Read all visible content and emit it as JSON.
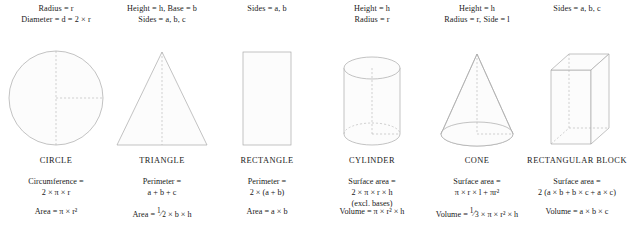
{
  "sheet": {
    "title": "Geometry formulas reference",
    "columns": [
      {
        "id": "circle",
        "name": "CIRCLE",
        "dimensions": [
          "Radius = r",
          "Diameter = d = 2 × r"
        ],
        "formula_1_label": "Circumference =",
        "formula_1_value": "2 × π × r",
        "formula_2": "Area = π × r²",
        "figure": "circle-figure"
      },
      {
        "id": "triangle",
        "name": "TRIANGLE",
        "dimensions": [
          "Height = h, Base = b",
          "Sides = a, b, c"
        ],
        "formula_1_label": "Perimeter =",
        "formula_1_value": "a + b + c",
        "formula_2_prefix": "Area = ",
        "formula_2_fraction_num": "1",
        "formula_2_fraction_den": "2",
        "formula_2_suffix": " × b × h",
        "figure": "triangle-figure"
      },
      {
        "id": "rectangle",
        "name": "RECTANGLE",
        "dimensions": [
          "Sides = a, b"
        ],
        "formula_1_label": "Perimeter =",
        "formula_1_value": "2 × (a + b)",
        "formula_2": "Area = a × b",
        "figure": "rectangle-figure"
      },
      {
        "id": "cylinder",
        "name": "CYLINDER",
        "dimensions": [
          "Height = h",
          "Radius = r"
        ],
        "formula_1_label": "Surface area =",
        "formula_1_value": "2 × π × r × h",
        "formula_1_note": "(excl. bases)",
        "formula_2": "Volume = π × r² × h",
        "figure": "cylinder-figure"
      },
      {
        "id": "cone",
        "name": "CONE",
        "dimensions": [
          "Height = h",
          "Radius = r, Side = l"
        ],
        "formula_1_label": "Surface area =",
        "formula_1_value": "π × r × l + πr²",
        "formula_2_prefix": "Volume = ",
        "formula_2_fraction_num": "1",
        "formula_2_fraction_den": "3",
        "formula_2_suffix": " × π × r² × h",
        "figure": "cone-figure"
      },
      {
        "id": "rectangular-block",
        "name": "RECTANGULAR BLOCK",
        "dimensions": [
          "Sides = a, b, c"
        ],
        "formula_1_label": "Surface area =",
        "formula_1_value": "2 (a × b + b × c + a × c)",
        "formula_2": "Volume = a × b × c",
        "figure": "rectangular-block-figure"
      }
    ]
  },
  "colors": {
    "background": "#ffffff",
    "text": "#1a1a1a",
    "outline": "#a9a9a9",
    "dashed": "#b4b4b4",
    "fill": "#fcfcfc"
  }
}
